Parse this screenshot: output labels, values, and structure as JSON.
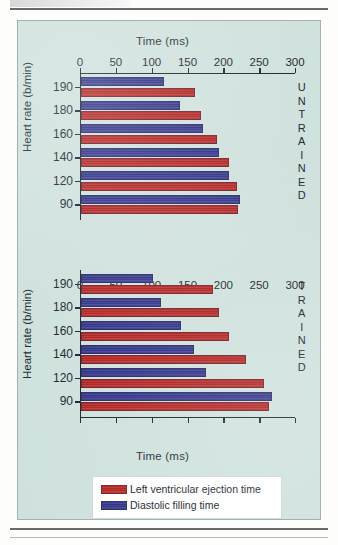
{
  "figure": {
    "background_color": "#cfe1dd",
    "legend": [
      {
        "label": "Left ventricular ejection time",
        "color": "#b41f1d",
        "series": "red"
      },
      {
        "label": "Diastolic filling time",
        "color": "#2b2d86",
        "series": "blue"
      }
    ],
    "groups": [
      {
        "id": "untrained",
        "word": "UNTRAINED",
        "letters": [
          "U",
          "N",
          "T",
          "R",
          "A",
          "I",
          "N",
          "E",
          "D"
        ]
      },
      {
        "id": "trained",
        "word": "TRAINED",
        "letters": [
          "T",
          "R",
          "A",
          "I",
          "N",
          "E",
          "D"
        ]
      }
    ]
  },
  "chart_data": {
    "type": "bar",
    "orientation": "horizontal",
    "title": "",
    "xlabel": "Time (ms)",
    "ylabel": "Heart rate (b/min)",
    "xlim": [
      0,
      300
    ],
    "xticks": [
      0,
      50,
      100,
      150,
      200,
      250,
      300
    ],
    "xticklabels": [
      "0",
      "50",
      "100",
      "150",
      "200",
      "250",
      "300"
    ],
    "grid": false,
    "legend_position": "bottom-center",
    "categories": [
      "190",
      "180",
      "160",
      "140",
      "120",
      "90"
    ],
    "panels": [
      {
        "name": "UNTRAINED",
        "ylabel": "Heart rate (b/min)",
        "xlabel": "Time (ms)",
        "xlabel_position": "top",
        "categories": [
          "190",
          "180",
          "160",
          "140",
          "120",
          "90"
        ],
        "series": [
          {
            "name": "Diastolic filling time",
            "key": "blue",
            "values": [
              116,
              138,
              170,
              192,
              207,
              222
            ]
          },
          {
            "name": "Left ventricular ejection time",
            "key": "red",
            "values": [
              159,
              168,
              190,
              206,
              217,
              219
            ]
          }
        ]
      },
      {
        "name": "TRAINED",
        "ylabel": "Heart rate (b/min)",
        "xlabel": "Time (ms)",
        "xlabel_position": "bottom",
        "categories": [
          "190",
          "180",
          "160",
          "140",
          "120",
          "90"
        ],
        "series": [
          {
            "name": "Diastolic filling time",
            "key": "blue",
            "values": [
              100,
              112,
              140,
              158,
              175,
              267
            ]
          },
          {
            "name": "Left ventricular ejection time",
            "key": "red",
            "values": [
              184,
              192,
              206,
              230,
              256,
              262
            ]
          }
        ]
      }
    ]
  }
}
